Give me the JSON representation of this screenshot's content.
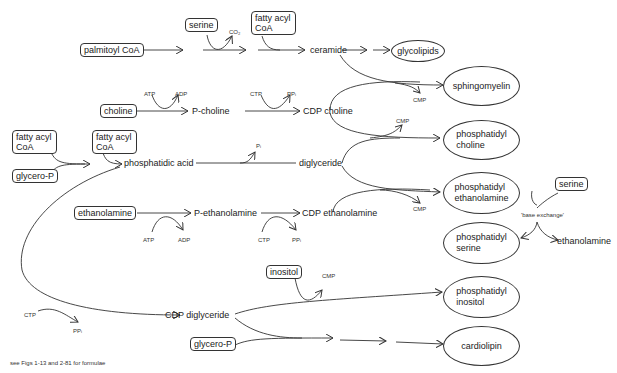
{
  "caption": "see Figs 1-13 and 2-81 for formulae",
  "boxes": {
    "palmitoyl_coa": "palmitoyl CoA",
    "serine_top": "serine",
    "fatty_acyl_coa_top": "fatty acyl CoA",
    "choline": "choline",
    "fatty_acyl_coa_left": "fatty acyl CoA",
    "fatty_acyl_coa_mid": "fatty acyl CoA",
    "glycero_p_top": "glycero-P",
    "ethanolamine": "ethanolamine",
    "inositol": "inositol",
    "glycero_p_bottom": "glycero-P",
    "serine_right": "serine"
  },
  "intermediates": {
    "ceramide": "ceramide",
    "p_choline": "P-choline",
    "cdp_choline": "CDP choline",
    "phosphatidic_acid": "phosphatidic acid",
    "diglyceride": "diglyceride",
    "p_ethanolamine": "P-ethanolamine",
    "cdp_ethanolamine": "CDP ethanolamine",
    "cdp_diglyceride": "CDP diglyceride",
    "base_exchange": "'base exchange'",
    "ethanolamine_out": "ethanolamine"
  },
  "products": {
    "glycolipids": "glycolipids",
    "sphingomyelin": "sphingomyelin",
    "phosphatidyl_choline_1": "phosphatidyl",
    "phosphatidyl_choline_2": "choline",
    "phosphatidyl_ethanolamine_1": "phosphatidyl",
    "phosphatidyl_ethanolamine_2": "ethanolamine",
    "phosphatidyl_serine_1": "phosphatidyl",
    "phosphatidyl_serine_2": "serine",
    "phosphatidyl_inositol_1": "phosphatidyl",
    "phosphatidyl_inositol_2": "inositol",
    "cardiolipin": "cardiolipin"
  },
  "cofactors": {
    "co2": "CO₂",
    "atp_choline": "ATP",
    "adp_choline": "ADP",
    "ctp_choline": "CTP",
    "ppi_choline": "PPᵢ",
    "cmp_sphingo": "CMP",
    "cmp_pc": "CMP",
    "pi": "Pᵢ",
    "cmp_pe": "CMP",
    "atp_eth": "ATP",
    "adp_eth": "ADP",
    "ctp_eth": "CTP",
    "ppi_eth": "PPᵢ",
    "ctp_cdpdg": "CTP",
    "ppi_cdpdg": "PPᵢ",
    "cmp_pi": "CMP"
  }
}
